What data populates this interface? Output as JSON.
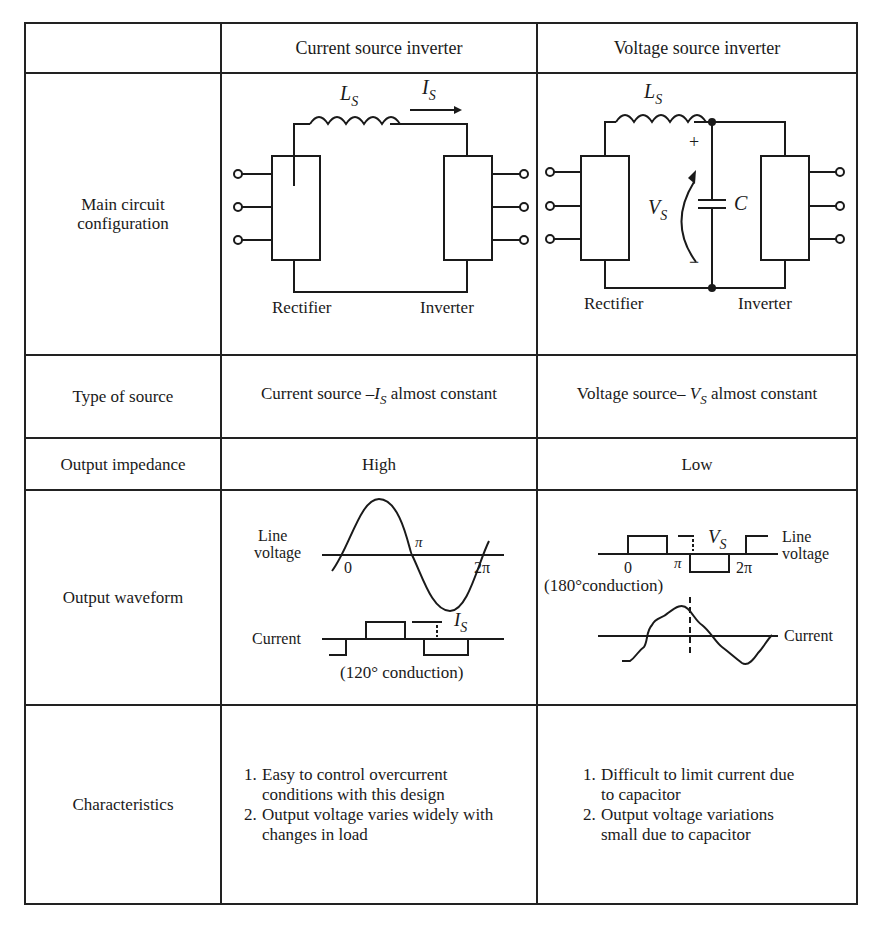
{
  "table": {
    "header": {
      "corner": "",
      "col1": "Current source inverter",
      "col2": "Voltage source inverter"
    },
    "rows": {
      "circuit": {
        "label_line1": "Main circuit",
        "label_line2": "configuration",
        "csi": {
          "inductor": "L",
          "inductor_sub": "S",
          "current": "I",
          "current_sub": "S",
          "left_block": "Rectifier",
          "right_block": "Inverter"
        },
        "vsi": {
          "inductor": "L",
          "inductor_sub": "S",
          "voltage": "V",
          "voltage_sub": "S",
          "capacitor": "C",
          "plus": "+",
          "minus": "−",
          "left_block": "Rectifier",
          "right_block": "Inverter"
        }
      },
      "source": {
        "label": "Type of source",
        "csi_prefix": "Current source –",
        "csi_sym": "I",
        "csi_sub": "S",
        "csi_suffix": " almost constant",
        "vsi_prefix": "Voltage source– ",
        "vsi_sym": "V",
        "vsi_sub": "S",
        "vsi_suffix": " almost constant"
      },
      "impedance": {
        "label": "Output impedance",
        "csi": "High",
        "vsi": "Low"
      },
      "waveform": {
        "label": "Output waveform",
        "csi": {
          "voltage_label_1": "Line",
          "voltage_label_2": "voltage",
          "tick_0": "0",
          "tick_pi": "π",
          "tick_2pi": "2π",
          "current_label": "Current",
          "amp_sym": "I",
          "amp_sub": "S",
          "note": "(120° conduction)"
        },
        "vsi": {
          "voltage_label_1": "Line",
          "voltage_label_2": "voltage",
          "tick_0": "0",
          "tick_pi": "π",
          "tick_2pi": "2π",
          "current_label": "Current",
          "amp_sym": "V",
          "amp_sub": "S",
          "note": "(180°conduction)"
        }
      },
      "characteristics": {
        "label": "Characteristics",
        "csi": [
          {
            "num": "1.",
            "text": "Easy to control overcurrent conditions with this design"
          },
          {
            "num": "2.",
            "text": "Output voltage varies widely with changes in load"
          }
        ],
        "vsi": [
          {
            "num": "1.",
            "text": "Difficult to limit current due to capacitor"
          },
          {
            "num": "2.",
            "text": "Output voltage variations small due to capacitor"
          }
        ]
      }
    }
  }
}
